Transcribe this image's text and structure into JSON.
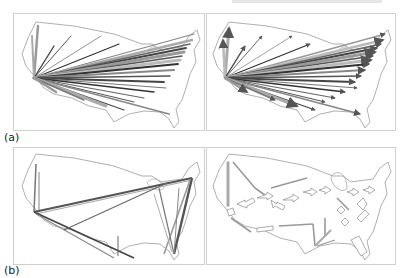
{
  "figure": {
    "rows": [
      {
        "label": "(a)",
        "panels": [
          {
            "name": "flow-map-raw-edges",
            "description": "Straight-line flows from a single west-coast origin to many destinations"
          },
          {
            "name": "flow-map-arrows",
            "description": "Same flows drawn as tapered arrows with arrowheads"
          }
        ]
      },
      {
        "label": "(b)",
        "panels": [
          {
            "name": "flow-map-bundled-edges",
            "description": "Bundled edges along a loop route across the map"
          },
          {
            "name": "flow-map-bundled-arrows",
            "description": "Bundled flow rendered as hollow arrow segments"
          }
        ]
      }
    ],
    "colors": {
      "outline": "#9a9a9a",
      "frame": "#cfcfcf",
      "flow_dark": "#3a3a3a",
      "flow_light": "#a0a0a0"
    }
  }
}
